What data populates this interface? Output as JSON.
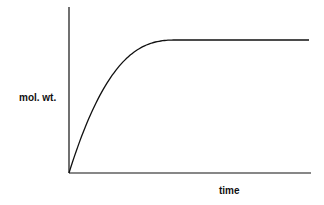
{
  "chart_data": {
    "type": "line",
    "title": "",
    "xlabel": "time",
    "ylabel": "mol. wt.",
    "grid": false,
    "legend": null,
    "x_ticks": [],
    "y_ticks": [],
    "series": [
      {
        "name": "mol. wt. vs time",
        "description": "rises rapidly from zero, decelerating, then reaches a constant plateau",
        "x": [
          0,
          0.1,
          0.2,
          0.3,
          0.45,
          1.0
        ],
        "values": [
          0,
          0.45,
          0.72,
          0.9,
          1.0,
          1.0
        ]
      }
    ],
    "xlim": [
      0,
      1
    ],
    "ylim": [
      0,
      1.2
    ]
  },
  "labels": {
    "x": "time",
    "y": "mol. wt."
  },
  "colors": {
    "line": "#111111",
    "axes": "#111111",
    "background": "#ffffff"
  }
}
